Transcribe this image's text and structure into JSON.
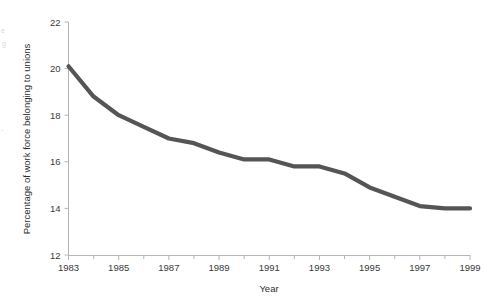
{
  "chart_data": {
    "type": "line",
    "title": "",
    "xlabel": "Year",
    "ylabel": "Percentage of work force belonging to unions",
    "x": [
      1983,
      1984,
      1985,
      1986,
      1987,
      1988,
      1989,
      1990,
      1991,
      1992,
      1993,
      1994,
      1995,
      1996,
      1997,
      1998,
      1999
    ],
    "values": [
      20.1,
      18.8,
      18.0,
      17.5,
      17.0,
      16.8,
      16.4,
      16.1,
      16.1,
      15.8,
      15.8,
      15.5,
      14.9,
      14.5,
      14.1,
      14.0,
      14.0
    ],
    "series": [
      {
        "name": "Percentage of work force belonging to unions",
        "values": [
          20.1,
          18.8,
          18.0,
          17.5,
          17.0,
          16.8,
          16.4,
          16.1,
          16.1,
          15.8,
          15.8,
          15.5,
          14.9,
          14.5,
          14.1,
          14.0,
          14.0
        ]
      }
    ],
    "xlim": [
      1983,
      1999
    ],
    "ylim": [
      12,
      22
    ],
    "x_tick_labels": [
      "1983",
      "1985",
      "1987",
      "1989",
      "1991",
      "1993",
      "1995",
      "1997",
      "1999"
    ],
    "x_tick_values": [
      1983,
      1985,
      1987,
      1989,
      1991,
      1993,
      1995,
      1997,
      1999
    ],
    "x_minor_tick_values": [
      1984,
      1986,
      1988,
      1990,
      1992,
      1994,
      1996,
      1998
    ],
    "y_tick_labels": [
      "12",
      "14",
      "16",
      "18",
      "20",
      "22"
    ],
    "y_tick_values": [
      12,
      14,
      16,
      18,
      20,
      22
    ],
    "grid": false,
    "legend": false,
    "legend_position": "none",
    "line_color": "#555555",
    "axis_color": "#b4b4b4",
    "text_color": "#333333",
    "background_color": "#ffffff"
  },
  "axes": {
    "y_title": "Percentage of work force belonging to unions",
    "x_title": "Year",
    "y_ticks": [
      {
        "label": "22",
        "value": 22
      },
      {
        "label": "20",
        "value": 20
      },
      {
        "label": "18",
        "value": 18
      },
      {
        "label": "16",
        "value": 16
      },
      {
        "label": "14",
        "value": 14
      },
      {
        "label": "12",
        "value": 12
      }
    ],
    "x_ticks": [
      {
        "label": "1983",
        "value": 1983
      },
      {
        "label": "1985",
        "value": 1985
      },
      {
        "label": "1987",
        "value": 1987
      },
      {
        "label": "1989",
        "value": 1989
      },
      {
        "label": "1991",
        "value": 1991
      },
      {
        "label": "1993",
        "value": 1993
      },
      {
        "label": "1995",
        "value": 1995
      },
      {
        "label": "1997",
        "value": 1997
      },
      {
        "label": "1999",
        "value": 1999
      }
    ]
  },
  "artifacts": {
    "edge_marks": [
      "e",
      "g",
      "-"
    ]
  }
}
